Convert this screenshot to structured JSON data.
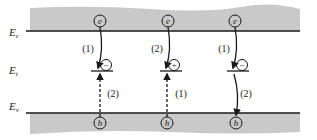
{
  "labels": {
    "ec": "E",
    "ec_sub": "c",
    "et": "E",
    "et_sub": "t",
    "ev": "E",
    "ev_sub": "v"
  },
  "colors": {
    "band_fill": "#c9c9c9",
    "line": "#1a1a1a"
  },
  "processes": [
    {
      "electron_label": "e",
      "hole_label": "h",
      "trap_charge": "−",
      "top_step": "(1)",
      "bottom_step": "(2)",
      "top_arrow": "solid-down",
      "bottom_arrow": "dashed-up"
    },
    {
      "electron_label": "e",
      "hole_label": "h",
      "trap_charge": "+",
      "top_step": "(2)",
      "bottom_step": "(1)",
      "top_arrow": "solid-down",
      "bottom_arrow": "dashed-up"
    },
    {
      "electron_label": "e",
      "hole_label": "h",
      "trap_charge": "−",
      "top_step": "(1)",
      "bottom_step": "(2)",
      "top_arrow": "solid-down",
      "bottom_arrow": "solid-down"
    }
  ]
}
